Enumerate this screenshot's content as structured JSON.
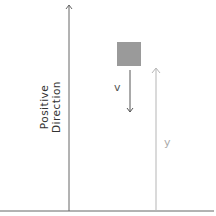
{
  "diagram": {
    "axis_label_line1": "Positive",
    "axis_label_line2": "Direction",
    "velocity_label": "v",
    "position_label": "y",
    "colors": {
      "box": "#9a9a9a",
      "axis": "#666666",
      "velocity_arrow": "#555555",
      "position_arrow": "#b5b5b5",
      "ground": "#666666"
    }
  }
}
